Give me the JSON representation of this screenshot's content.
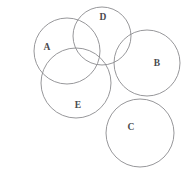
{
  "figure": {
    "kind": "venn-diagram",
    "width": 189,
    "height": 172,
    "background_color": "#ffffff",
    "stroke_color": "#8b8b8f",
    "label_color": "#4a4a4e"
  },
  "sets": [
    {
      "id": "A",
      "label": "A",
      "cx": 67,
      "cy": 51,
      "r": 33,
      "label_x": 47,
      "label_y": 48
    },
    {
      "id": "D",
      "label": "D",
      "cx": 102,
      "cy": 36,
      "r": 29,
      "label_x": 103,
      "label_y": 18
    },
    {
      "id": "B",
      "label": "B",
      "cx": 147,
      "cy": 63,
      "r": 33,
      "label_x": 157,
      "label_y": 64
    },
    {
      "id": "E",
      "label": "E",
      "cx": 76,
      "cy": 83,
      "r": 35,
      "label_x": 78,
      "label_y": 106
    },
    {
      "id": "C",
      "label": "C",
      "cx": 140,
      "cy": 133,
      "r": 34,
      "label_x": 131,
      "label_y": 128
    }
  ]
}
